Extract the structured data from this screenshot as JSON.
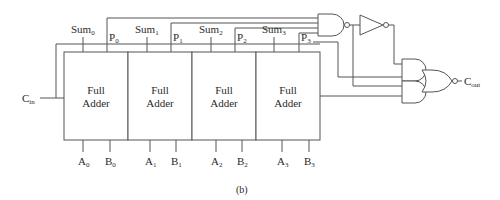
{
  "figure": {
    "caption": "(b)"
  },
  "adders": [
    {
      "line1": "Full",
      "line2": "Adder",
      "sum": {
        "base": "Sum",
        "sub": "0"
      },
      "p": {
        "base": "P",
        "sub": "0"
      },
      "a": {
        "base": "A",
        "sub": "0"
      },
      "b": {
        "base": "B",
        "sub": "0"
      }
    },
    {
      "line1": "Full",
      "line2": "Adder",
      "sum": {
        "base": "Sum",
        "sub": "1"
      },
      "p": {
        "base": "P",
        "sub": "1"
      },
      "a": {
        "base": "A",
        "sub": "1"
      },
      "b": {
        "base": "B",
        "sub": "1"
      }
    },
    {
      "line1": "Full",
      "line2": "Adder",
      "sum": {
        "base": "Sum",
        "sub": "2"
      },
      "p": {
        "base": "P",
        "sub": "2"
      },
      "a": {
        "base": "A",
        "sub": "2"
      },
      "b": {
        "base": "B",
        "sub": "2"
      }
    },
    {
      "line1": "Full",
      "line2": "Adder",
      "sum": {
        "base": "Sum",
        "sub": "3"
      },
      "p": {
        "base": "P",
        "sub": "3"
      },
      "a": {
        "base": "A",
        "sub": "3"
      },
      "b": {
        "base": "B",
        "sub": "3"
      }
    }
  ],
  "carry_in": {
    "base": "C",
    "sub": "in"
  },
  "carry_out": {
    "base": "C",
    "sub": "out"
  },
  "gates": [
    "nand-4-input",
    "inverter",
    "and-gate-upper",
    "and-gate-lower",
    "nor-gate-output"
  ],
  "colors": {
    "line": "#555555",
    "text": "#2a2a2a",
    "background": "#ffffff"
  }
}
